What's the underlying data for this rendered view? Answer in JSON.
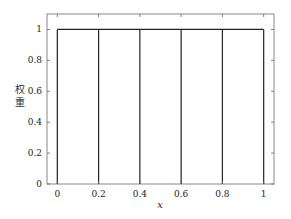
{
  "chart_data": {
    "type": "line",
    "title": "",
    "xlabel": "x",
    "ylabel": "权重",
    "x": [
      0,
      0.2,
      0.4,
      0.6,
      0.8,
      1
    ],
    "series": [
      {
        "name": "weights",
        "style": "stem-box",
        "x": [
          0,
          0.2,
          0.4,
          0.6,
          0.8,
          1
        ],
        "values": [
          1,
          1,
          1,
          1,
          1,
          1
        ]
      }
    ],
    "xlim": [
      -0.05,
      1.05
    ],
    "ylim": [
      0,
      1.1
    ],
    "xticks": [
      0,
      0.2,
      0.4,
      0.6,
      0.8,
      1
    ],
    "xtick_labels": [
      "0",
      "0.2",
      "0.4",
      "0.6",
      "0.8",
      "1"
    ],
    "yticks": [
      0,
      0.2,
      0.4,
      0.6,
      0.8,
      1
    ],
    "ytick_labels": [
      "0",
      "0.2",
      "0.4",
      "0.6",
      "0.8",
      "1"
    ],
    "grid": false,
    "legend": null
  },
  "axes_px": {
    "left": 47,
    "right": 274,
    "top": 14,
    "bottom": 184
  },
  "colors": {
    "line": "#222222",
    "axes": "#888888",
    "tick": "#666666"
  }
}
